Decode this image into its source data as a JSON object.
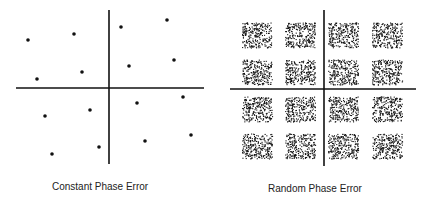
{
  "left_diagram": {
    "caption": "Constant Phase Error",
    "axes": {
      "vx": 109,
      "vy1": 10,
      "vy2": 164,
      "hy": 88,
      "hx1": 16,
      "hx2": 204
    },
    "points": [
      [
        28,
        40
      ],
      [
        74,
        34
      ],
      [
        121,
        27
      ],
      [
        167,
        20
      ],
      [
        82,
        72
      ],
      [
        129,
        66
      ],
      [
        174,
        60
      ],
      [
        37,
        79
      ],
      [
        90,
        110
      ],
      [
        137,
        103
      ],
      [
        183,
        97
      ],
      [
        45,
        116
      ],
      [
        99,
        147
      ],
      [
        145,
        141
      ],
      [
        191,
        135
      ],
      [
        52,
        154
      ]
    ]
  },
  "right_diagram": {
    "caption": "Random Phase Error",
    "axes": {
      "vx": 324,
      "vy1": 10,
      "vy2": 166,
      "hy": 89,
      "hx1": 230,
      "hx2": 416
    },
    "cluster_centers_x": [
      257,
      300,
      343,
      387
    ],
    "cluster_centers_y": [
      35,
      72,
      109,
      146
    ],
    "cluster_size": [
      30,
      25
    ]
  },
  "colors": {
    "ink": "#111111",
    "background": "#ffffff"
  }
}
